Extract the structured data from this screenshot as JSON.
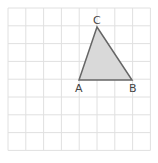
{
  "grid": {
    "x0": 8,
    "y0": 8,
    "cell": 17.8,
    "cols": 8,
    "rows": 8,
    "line_color": "#e0e0e0"
  },
  "triangle": {
    "fill": "#d9d9d9",
    "stroke": "#666666",
    "vertices": {
      "A": {
        "label": "A",
        "x": 79,
        "y": 80
      },
      "B": {
        "label": "B",
        "x": 132,
        "y": 80
      },
      "C": {
        "label": "C",
        "x": 97,
        "y": 27
      }
    }
  }
}
